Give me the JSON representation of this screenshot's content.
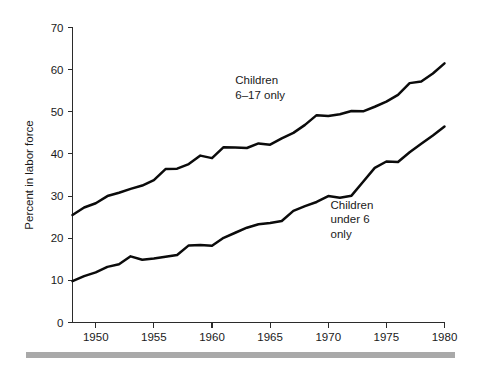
{
  "chart_data": {
    "type": "line",
    "title": "",
    "xlabel": "",
    "ylabel": "Percent in labor force",
    "xlim": [
      1948,
      1980
    ],
    "ylim": [
      0,
      70
    ],
    "grid": false,
    "legend_position": "inline-annotations",
    "x_ticks": [
      "1950",
      "1955",
      "1960",
      "1965",
      "1970",
      "1975",
      "1980"
    ],
    "x_tick_values": [
      1950,
      1955,
      1960,
      1965,
      1970,
      1975,
      1980
    ],
    "y_ticks": [
      "0",
      "10",
      "20",
      "30",
      "40",
      "50",
      "60",
      "70"
    ],
    "y_tick_values": [
      0,
      10,
      20,
      30,
      40,
      50,
      60,
      70
    ],
    "x": [
      1948,
      1949,
      1950,
      1951,
      1952,
      1953,
      1954,
      1955,
      1956,
      1957,
      1958,
      1959,
      1960,
      1961,
      1962,
      1963,
      1964,
      1965,
      1966,
      1967,
      1968,
      1969,
      1970,
      1971,
      1972,
      1973,
      1974,
      1975,
      1976,
      1977,
      1978,
      1979,
      1980
    ],
    "series": [
      {
        "name": "Children 6-17 only",
        "color": "#0b0b0b",
        "values": [
          25.5,
          27.3,
          28.3,
          30.0,
          30.8,
          31.7,
          32.5,
          33.8,
          36.4,
          36.5,
          37.6,
          39.6,
          39.0,
          41.6,
          41.5,
          41.4,
          42.5,
          42.2,
          43.7,
          45.0,
          46.9,
          49.2,
          49.0,
          49.4,
          50.2,
          50.1,
          51.2,
          52.4,
          54.0,
          56.8,
          57.2,
          59.1,
          61.5
        ]
      },
      {
        "name": "Children under 6 only",
        "color": "#0b0b0b",
        "values": [
          9.8,
          11.0,
          11.9,
          13.2,
          13.8,
          15.7,
          14.9,
          15.2,
          15.6,
          16.0,
          18.3,
          18.4,
          18.2,
          20.1,
          21.3,
          22.5,
          23.3,
          23.6,
          24.1,
          26.5,
          27.6,
          28.6,
          30.0,
          29.6,
          30.1,
          33.4,
          36.7,
          38.2,
          38.1,
          40.4,
          42.4,
          44.4,
          46.5
        ]
      }
    ],
    "annotations": [
      {
        "name": "annotation-children-6-17",
        "lines": [
          "Children",
          "6–17 only"
        ],
        "x_data": 1962.0,
        "y_data": 56.5
      },
      {
        "name": "annotation-children-under-6",
        "lines": [
          "Children",
          "under 6",
          "only"
        ],
        "x_data": 1970.2,
        "y_data": 27.0
      }
    ]
  },
  "figure": {
    "footer_rule_color": "#a9a9a9"
  }
}
